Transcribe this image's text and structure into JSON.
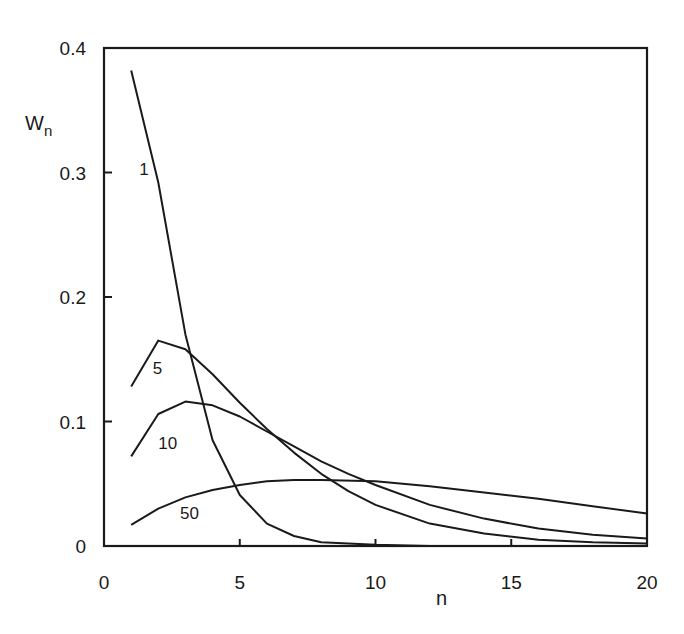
{
  "chart_data": {
    "type": "line",
    "title": "",
    "xlabel": "n",
    "ylabel": "W",
    "ylabel_sub": "n",
    "xlim": [
      0,
      20
    ],
    "ylim": [
      0,
      0.4
    ],
    "xticks": [
      0,
      5,
      10,
      15,
      20
    ],
    "yticks": [
      0,
      0.1,
      0.2,
      0.3,
      0.4
    ],
    "xtick_labels": [
      "0",
      "5",
      "10",
      "15",
      "20"
    ],
    "ytick_labels": [
      "0",
      "0.1",
      "0.2",
      "0.3",
      "0.4"
    ],
    "grid": false,
    "legend": "inline curve labels",
    "series": [
      {
        "name": "1",
        "x": [
          1,
          2,
          3,
          4,
          5,
          6,
          7,
          8,
          10,
          12,
          15,
          20
        ],
        "values": [
          0.382,
          0.292,
          0.17,
          0.085,
          0.041,
          0.018,
          0.008,
          0.003,
          0.001,
          0.0,
          0.0,
          0.0
        ],
        "label_pos": [
          1.3,
          0.298
        ]
      },
      {
        "name": "5",
        "x": [
          1,
          2,
          3,
          4,
          5,
          6,
          7,
          8,
          9,
          10,
          12,
          14,
          16,
          18,
          20
        ],
        "values": [
          0.128,
          0.165,
          0.158,
          0.138,
          0.115,
          0.094,
          0.075,
          0.058,
          0.044,
          0.033,
          0.018,
          0.01,
          0.005,
          0.003,
          0.002
        ],
        "label_pos": [
          1.8,
          0.138
        ]
      },
      {
        "name": "10",
        "x": [
          1,
          2,
          3,
          4,
          5,
          6,
          7,
          8,
          9,
          10,
          12,
          14,
          16,
          18,
          20
        ],
        "values": [
          0.072,
          0.106,
          0.116,
          0.113,
          0.104,
          0.092,
          0.08,
          0.068,
          0.058,
          0.049,
          0.033,
          0.022,
          0.014,
          0.009,
          0.006
        ],
        "label_pos": [
          2.0,
          0.078
        ]
      },
      {
        "name": "50",
        "x": [
          1,
          2,
          3,
          4,
          5,
          6,
          7,
          8,
          10,
          12,
          14,
          16,
          18,
          20
        ],
        "values": [
          0.017,
          0.03,
          0.039,
          0.045,
          0.049,
          0.052,
          0.053,
          0.053,
          0.052,
          0.048,
          0.043,
          0.038,
          0.032,
          0.026
        ],
        "label_pos": [
          2.8,
          0.022
        ]
      }
    ]
  },
  "plot": {
    "left": 104,
    "right": 647,
    "top": 48,
    "bottom": 546
  }
}
